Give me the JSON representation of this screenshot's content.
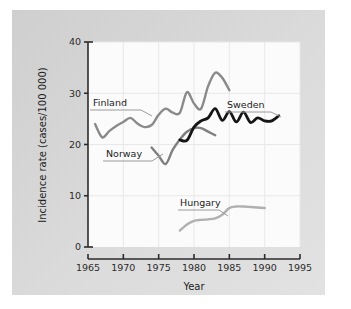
{
  "chart_data": {
    "type": "line",
    "title": "",
    "xlabel": "Year",
    "ylabel": "Incidence rate (cases/100 000)",
    "xlim": [
      1965,
      1995
    ],
    "ylim": [
      0,
      40
    ],
    "xticks": [
      1965,
      1970,
      1975,
      1980,
      1985,
      1990,
      1995
    ],
    "yticks": [
      0,
      10,
      20,
      30,
      40
    ],
    "grid": true,
    "legend_position": "inline-labels",
    "series": [
      {
        "name": "Finland",
        "color": "#8a8a8a",
        "label_x": 1967.5,
        "label_y": 28.6,
        "x": [
          1966,
          1967,
          1968,
          1969,
          1970,
          1971,
          1972,
          1973,
          1974,
          1975,
          1976,
          1977,
          1978,
          1979,
          1980,
          1981,
          1982,
          1983,
          1984,
          1985
        ],
        "y": [
          24.0,
          21.4,
          22.6,
          23.6,
          24.4,
          25.2,
          24.1,
          23.4,
          23.8,
          25.8,
          27.0,
          26.2,
          26.2,
          30.2,
          28.0,
          27.0,
          31.4,
          34.0,
          33.0,
          30.6
        ]
      },
      {
        "name": "Norway",
        "color": "#7f7f7f",
        "label_x": 1970.0,
        "label_y": 17.4,
        "x": [
          1974,
          1975,
          1976,
          1977,
          1978,
          1979,
          1980,
          1981,
          1982,
          1983
        ],
        "y": [
          19.4,
          17.8,
          16.2,
          19.0,
          21.0,
          22.5,
          23.2,
          23.2,
          22.5,
          21.8
        ]
      },
      {
        "name": "Sweden",
        "color": "#151515",
        "label_x": 1985.0,
        "label_y": 28.0,
        "x": [
          1978,
          1979,
          1980,
          1981,
          1982,
          1983,
          1984,
          1985,
          1986,
          1987,
          1988,
          1989,
          1990,
          1991,
          1992
        ],
        "y": [
          20.9,
          20.8,
          23.4,
          24.6,
          25.2,
          27.0,
          24.7,
          26.4,
          24.4,
          26.3,
          24.3,
          25.2,
          24.6,
          24.6,
          25.6
        ]
      },
      {
        "name": "Hungary",
        "color": "#b0b0b0",
        "label_x": 1979.5,
        "label_y": 9.3,
        "x": [
          1978,
          1979,
          1980,
          1981,
          1982,
          1983,
          1984,
          1985,
          1986,
          1987,
          1988,
          1989,
          1990
        ],
        "y": [
          3.2,
          4.4,
          5.1,
          5.3,
          5.4,
          5.6,
          6.3,
          7.6,
          7.9,
          7.9,
          7.8,
          7.7,
          7.6
        ]
      }
    ]
  },
  "axes": {
    "x_title": "Year",
    "y_title": "Incidence rate (cases/100 000)",
    "x_tick_labels": [
      "1965",
      "1970",
      "1975",
      "1980",
      "1985",
      "1990",
      "1995"
    ],
    "y_tick_labels": [
      "0",
      "10",
      "20",
      "30",
      "40"
    ]
  },
  "labels": {
    "finland": "Finland",
    "norway": "Norway",
    "sweden": "Sweden",
    "hungary": "Hungary"
  },
  "colors": {
    "finland": "#8a8a8a",
    "norway": "#7f7f7f",
    "sweden": "#151515",
    "hungary": "#b0b0b0",
    "axis": "#2b2b2b",
    "grid": "#e8e8e8",
    "plot_bg": "#fbfbfb",
    "panel_bg": "#d6d6d6"
  }
}
